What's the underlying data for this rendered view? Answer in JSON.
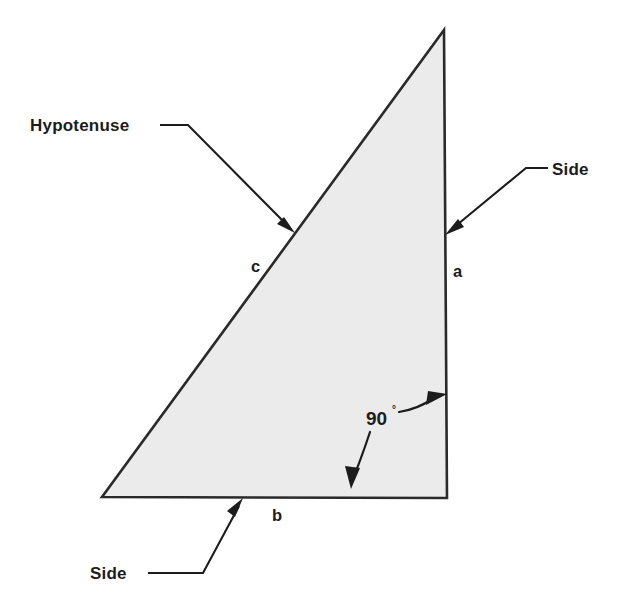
{
  "figure": {
    "background_color": "#ffffff",
    "ink_color": "#1c1c1c"
  },
  "shape": {
    "name": "right-triangle",
    "fill_color": "#ebebeb",
    "stroke_color": "#2a2a2a",
    "vertices": {
      "apex": [
        444,
        30
      ],
      "bottom_left": [
        102,
        497
      ],
      "bottom_right": [
        447,
        498
      ]
    }
  },
  "labels": {
    "hypotenuse_callout": "Hypotenuse",
    "side_right_callout": "Side",
    "side_bottom_callout": "Side",
    "side_c": "c",
    "side_a": "a",
    "side_b": "b",
    "right_angle": "90",
    "degree_symbol": "°"
  },
  "annotations": {
    "hypotenuse_points_to": "c",
    "side_right_points_to": "a",
    "side_bottom_points_to": "b",
    "right_angle_between": [
      "a",
      "b"
    ]
  }
}
